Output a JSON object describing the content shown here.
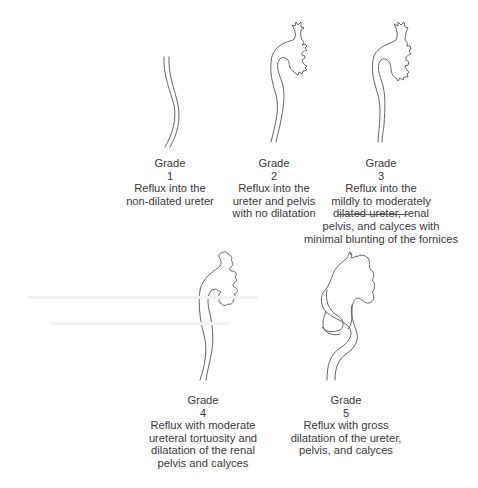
{
  "figure": {
    "type": "vesicoureteral reflux grading diagram",
    "grades": [
      {
        "heading": "Grade",
        "number": "1",
        "description": [
          "Reflux into the",
          "non-dilated ureter"
        ],
        "illustration": "non-dilated ureter"
      },
      {
        "heading": "Grade",
        "number": "2",
        "description": [
          "Reflux into the",
          "ureter and pelvis",
          "with no dilatation"
        ],
        "illustration": "ureter with renal pelvis and sharp calyces"
      },
      {
        "heading": "Grade",
        "number": "3",
        "description": [
          "Reflux into the",
          "mildly to moderately",
          "dilated ureter, renal",
          "pelvis, and calyces with",
          "minimal blunting of the fornices"
        ],
        "illustration": "mildly dilated ureter, pelvis and calyces"
      },
      {
        "heading": "Grade",
        "number": "4",
        "description": [
          "Reflux with moderate",
          "ureteral tortuosity and",
          "dilatation of the renal",
          "pelvis and calyces"
        ],
        "illustration": "tortuous ureter with dilated pelvis and blunted calyces"
      },
      {
        "heading": "Grade",
        "number": "5",
        "description": [
          "Reflux with gross",
          "dilatation of the ureter,",
          "pelvis, and calyces"
        ],
        "illustration": "grossly dilated tortuous ureter and pelvis"
      }
    ],
    "colors": {
      "line": "#555555",
      "text": "#3a3a3a",
      "background": "#ffffff"
    }
  }
}
